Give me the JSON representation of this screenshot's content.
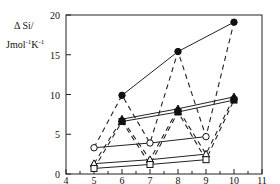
{
  "chart_data": {
    "type": "line",
    "title": "",
    "xlabel": "m",
    "ylabel": "ΔSi/ Jmol-1K-1",
    "ylabel_line1": "Δ Si/",
    "ylabel_line2_base": "Jmol",
    "ylabel_line2_exp1": "-1",
    "ylabel_line2_mid": "K",
    "ylabel_line2_exp2": "-1",
    "xlim": [
      4,
      11
    ],
    "ylim": [
      0,
      20
    ],
    "xticks": [
      4,
      5,
      6,
      7,
      8,
      9,
      10,
      11
    ],
    "yticks": [
      0,
      5,
      10,
      15,
      20
    ],
    "grid": false,
    "legend": "none",
    "series": [
      {
        "name": "filled-circle",
        "marker": "circle",
        "filled": true,
        "line": "solid",
        "x": [
          6,
          8,
          10
        ],
        "y": [
          9.9,
          15.4,
          19.1
        ]
      },
      {
        "name": "filled-triangle",
        "marker": "triangle",
        "filled": true,
        "line": "solid",
        "x": [
          6,
          8,
          10
        ],
        "y": [
          6.9,
          8.2,
          9.7
        ]
      },
      {
        "name": "filled-square",
        "marker": "square",
        "filled": true,
        "line": "solid",
        "x": [
          6,
          8,
          10
        ],
        "y": [
          6.6,
          7.8,
          9.3
        ]
      },
      {
        "name": "open-circle",
        "marker": "circle",
        "filled": false,
        "line": "solid",
        "x": [
          5,
          7,
          9
        ],
        "y": [
          3.3,
          3.9,
          4.7
        ]
      },
      {
        "name": "open-triangle",
        "marker": "triangle",
        "filled": false,
        "line": "solid",
        "x": [
          5,
          7,
          9
        ],
        "y": [
          1.3,
          1.8,
          2.5
        ]
      },
      {
        "name": "open-square",
        "marker": "square",
        "filled": false,
        "line": "solid",
        "x": [
          5,
          7,
          9
        ],
        "y": [
          0.7,
          1.2,
          1.8
        ]
      }
    ],
    "dashed_zigzags": [
      {
        "name": "circle-zigzag",
        "x": [
          5,
          6,
          7,
          8,
          9,
          10
        ],
        "y": [
          3.3,
          9.9,
          3.9,
          15.4,
          4.7,
          19.1
        ]
      },
      {
        "name": "triangle-zigzag",
        "x": [
          5,
          6,
          7,
          8,
          9,
          10
        ],
        "y": [
          1.3,
          6.9,
          1.8,
          8.2,
          2.5,
          9.7
        ]
      },
      {
        "name": "square-zigzag",
        "x": [
          5,
          6,
          7,
          8,
          9,
          10
        ],
        "y": [
          0.7,
          6.6,
          1.2,
          7.8,
          1.8,
          9.3
        ]
      }
    ]
  }
}
